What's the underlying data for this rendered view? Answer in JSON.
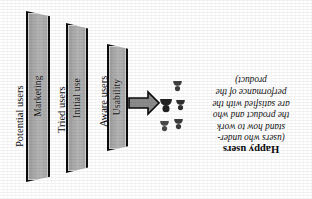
{
  "figure": {
    "orientation": "rotated-180",
    "background_color": "#ffffff",
    "panel_fill_color": "#b0b0b0",
    "panel_border_color": "#0d0d0d",
    "arrow_fill_color": "#8c8c8c"
  },
  "funnel": {
    "stages": [
      {
        "stage_label": "Potential users",
        "filter_label": "Marketing"
      },
      {
        "stage_label": "Tried users",
        "filter_label": "Initial use"
      },
      {
        "stage_label": "Aware users",
        "filter_label": "Usability"
      }
    ]
  },
  "outcome": {
    "title": "Happy users",
    "description_lines": [
      "(users who under-",
      "stand how to work",
      "the product and who",
      "are satisfied with the",
      "performance of the",
      "product)"
    ]
  },
  "icons": {
    "arrow": "arrow-left-icon",
    "person": "person-icon",
    "person_count": 5
  }
}
